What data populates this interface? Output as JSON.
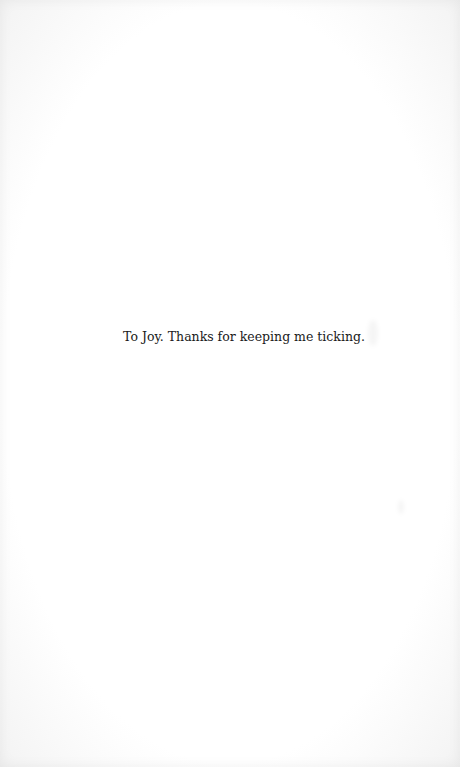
{
  "page": {
    "type": "dedication",
    "dedication_text": "To Joy. Thanks for keeping me ticking.",
    "background_color": "#ffffff",
    "text_color": "#1a1a1a"
  }
}
